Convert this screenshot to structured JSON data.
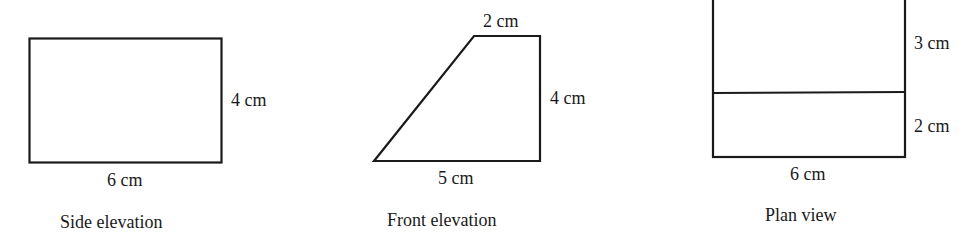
{
  "views": [
    {
      "caption": "Side elevation",
      "shape": "rectangle",
      "labels": {
        "bottom": "6 cm",
        "right": "4 cm"
      }
    },
    {
      "caption": "Front elevation",
      "shape": "trapezoid",
      "labels": {
        "top": "2 cm",
        "right": "4 cm",
        "bottom": "5 cm"
      }
    },
    {
      "caption": "Plan view",
      "shape": "rectangle-split",
      "labels": {
        "right_upper": "3 cm",
        "right_lower": "2 cm",
        "bottom": "6 cm"
      }
    }
  ],
  "stroke_color": "#1a1a1a"
}
